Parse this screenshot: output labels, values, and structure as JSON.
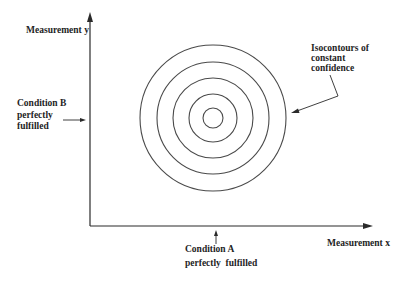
{
  "diagram": {
    "type": "confidence-isocontour-schematic",
    "axes": {
      "x_label": "Measurement x",
      "y_label": "Measurement y"
    },
    "annotations": {
      "condition_a": {
        "line1": "Condition A",
        "line2": "perfectly  fulfilled"
      },
      "condition_b": {
        "line1": "Condition B",
        "line2": "perfectly",
        "line3": "fulfilled"
      },
      "isocontours": {
        "line1": "Isocontours of",
        "line2": "constant",
        "line3": "confidence"
      }
    },
    "contours": {
      "count": 5,
      "shape": "concentric circles",
      "center_px": [
        213,
        118
      ],
      "radii_px": [
        10,
        24,
        40,
        56,
        73
      ]
    },
    "colors": {
      "background": "#ffffff",
      "ink": "#1e1e1e",
      "contour": "#4a4a4a"
    }
  }
}
